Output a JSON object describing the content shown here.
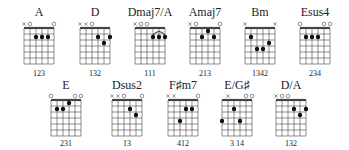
{
  "chart_data": {
    "type": "table",
    "strings": [
      "E",
      "A",
      "D",
      "G",
      "B",
      "e"
    ],
    "grid": {
      "strings": 6,
      "frets": 6,
      "string_gap": 6,
      "fret_gap": 6
    },
    "chords": [
      {
        "name": "A",
        "row": 0,
        "x": 24,
        "markers": [
          "x",
          "o",
          "",
          "",
          "",
          "o"
        ],
        "dots": [
          [
            2,
            2
          ],
          [
            3,
            2
          ],
          [
            4,
            2
          ]
        ],
        "barre": null,
        "fingering": "123"
      },
      {
        "name": "D",
        "row": 0,
        "x": 80,
        "markers": [
          "x",
          "x",
          "o",
          "",
          "",
          ""
        ],
        "dots": [
          [
            3,
            2
          ],
          [
            5,
            2
          ],
          [
            4,
            3
          ]
        ],
        "barre": null,
        "fingering": "132"
      },
      {
        "name": "Dmaj7/A",
        "row": 0,
        "x": 135,
        "markers": [
          "x",
          "o",
          "o",
          "",
          "",
          ""
        ],
        "dots": [
          [
            3,
            2
          ],
          [
            4,
            2
          ],
          [
            5,
            2
          ]
        ],
        "barre": [
          3,
          5,
          2
        ],
        "fingering": "111"
      },
      {
        "name": "Amaj7",
        "row": 0,
        "x": 190,
        "markers": [
          "x",
          "o",
          "",
          "",
          "",
          "o"
        ],
        "dots": [
          [
            3,
            1
          ],
          [
            2,
            2
          ],
          [
            4,
            2
          ]
        ],
        "barre": null,
        "fingering": "213"
      },
      {
        "name": "Bm",
        "row": 0,
        "x": 245,
        "markers": [
          "x",
          "",
          "",
          "",
          "",
          "x"
        ],
        "dots": [
          [
            1,
            2
          ],
          [
            4,
            3
          ],
          [
            2,
            4
          ],
          [
            3,
            4
          ]
        ],
        "barre": null,
        "fingering": "1342"
      },
      {
        "name": "Esus4",
        "row": 0,
        "x": 300,
        "markers": [
          "o",
          "",
          "",
          "",
          "o",
          "o"
        ],
        "dots": [
          [
            1,
            2
          ],
          [
            2,
            2
          ],
          [
            3,
            2
          ]
        ],
        "barre": null,
        "fingering": "234"
      },
      {
        "name": "E",
        "row": 1,
        "x": 51,
        "markers": [
          "o",
          "",
          "",
          "",
          "o",
          "o"
        ],
        "dots": [
          [
            3,
            1
          ],
          [
            1,
            2
          ],
          [
            2,
            2
          ]
        ],
        "barre": null,
        "fingering": "231"
      },
      {
        "name": "Dsus2",
        "row": 1,
        "x": 112,
        "markers": [
          "x",
          "x",
          "o",
          "",
          "",
          "o"
        ],
        "dots": [
          [
            3,
            2
          ],
          [
            4,
            3
          ]
        ],
        "barre": null,
        "fingering": "13"
      },
      {
        "name": "F♯m7",
        "row": 1,
        "x": 168,
        "markers": [
          "x",
          "x",
          "",
          "",
          "",
          "o"
        ],
        "dots": [
          [
            3,
            2
          ],
          [
            4,
            2
          ],
          [
            2,
            4
          ]
        ],
        "barre": null,
        "fingering": "412"
      },
      {
        "name": "E/G♯",
        "row": 1,
        "x": 222,
        "markers": [
          "",
          "x",
          "",
          "",
          "o",
          "o"
        ],
        "dots": [
          [
            2,
            2
          ],
          [
            0,
            4
          ],
          [
            3,
            4
          ]
        ],
        "barre": null,
        "fingering": "3 14"
      },
      {
        "name": "D/A",
        "row": 1,
        "x": 276,
        "markers": [
          "x",
          "o",
          "o",
          "",
          "",
          ""
        ],
        "dots": [
          [
            3,
            2
          ],
          [
            5,
            2
          ],
          [
            4,
            3
          ]
        ],
        "barre": null,
        "fingering": "132"
      }
    ],
    "rows": [
      {
        "name_y": 16,
        "nut_y": 28,
        "fing_y": 76
      },
      {
        "name_y": 89,
        "nut_y": 100,
        "fing_y": 146
      }
    ],
    "colors": {
      "line": "#444444",
      "dot": "#111111",
      "text": "#222222"
    }
  }
}
